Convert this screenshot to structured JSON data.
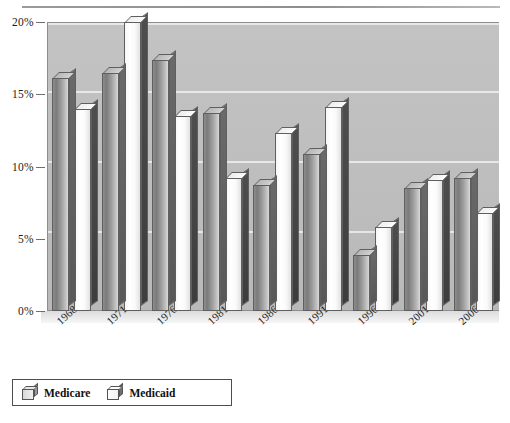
{
  "chart_data": {
    "type": "bar",
    "title": "",
    "subtitle": "",
    "xlabel": "",
    "ylabel": "",
    "categories": [
      "1968–1970",
      "1971–1975",
      "1976–1980",
      "1981–1985",
      "1986–1990",
      "1991–1995",
      "1996–2000",
      "2001–2005",
      "2006–2010"
    ],
    "series": [
      {
        "name": "Medicare",
        "values": [
          16.1,
          16.5,
          17.4,
          13.7,
          8.7,
          10.9,
          3.9,
          8.5,
          9.2
        ]
      },
      {
        "name": "Medicaid",
        "values": [
          14.0,
          20.0,
          13.5,
          9.2,
          12.3,
          14.1,
          5.8,
          9.1,
          6.8
        ]
      }
    ],
    "ylim": [
      0,
      20
    ],
    "yticks": [
      0,
      5,
      10,
      15,
      20
    ],
    "ytick_labels": [
      "0%",
      "5%",
      "10%",
      "15%",
      "20%"
    ],
    "grid": true,
    "legend_position": "bottom-left",
    "colors": {
      "medicare": "#9d9d9d",
      "medicaid": "#fafafa",
      "plot_background": "#bfbfbf",
      "gridline": "#efefef",
      "axis": "#8d8d8d",
      "text": "#1a1a1a"
    }
  },
  "legend": {
    "items": [
      {
        "label": "Medicare",
        "key": "medicare"
      },
      {
        "label": "Medicaid",
        "key": "medicaid"
      }
    ]
  },
  "caption": {
    "text": ""
  }
}
